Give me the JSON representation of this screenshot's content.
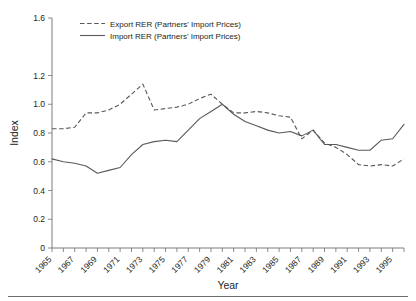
{
  "chart_data": {
    "type": "line",
    "title": "",
    "xlabel": "Year",
    "ylabel": "Index",
    "xlim": [
      1965,
      1996
    ],
    "ylim": [
      0,
      1.6
    ],
    "grid": false,
    "legend_position": "top-left-inside",
    "y_ticks": [
      "0",
      "0.2",
      "0.4",
      "0.6",
      "0.8",
      "1.0",
      "1.2",
      "1.6"
    ],
    "y_tick_values": [
      0,
      0.2,
      0.4,
      0.6,
      0.8,
      1.0,
      1.2,
      1.6
    ],
    "x_tick_labels": [
      "1965",
      "1967",
      "1969",
      "1971",
      "1973",
      "1975",
      "1977",
      "1979",
      "1981",
      "1983",
      "1985",
      "1987",
      "1989",
      "1991",
      "1993",
      "1995"
    ],
    "x_tick_values": [
      1965,
      1967,
      1969,
      1971,
      1973,
      1975,
      1977,
      1979,
      1981,
      1983,
      1985,
      1987,
      1989,
      1991,
      1993,
      1995
    ],
    "x": [
      1965,
      1966,
      1967,
      1968,
      1969,
      1970,
      1971,
      1972,
      1973,
      1974,
      1975,
      1976,
      1977,
      1978,
      1979,
      1980,
      1981,
      1982,
      1983,
      1984,
      1985,
      1986,
      1987,
      1988,
      1989,
      1990,
      1991,
      1992,
      1993,
      1994,
      1995,
      1996
    ],
    "series": [
      {
        "name": "Export RER (Partners' Import Prices)",
        "style": "dashed",
        "color": "#58595b",
        "values": [
          0.83,
          0.83,
          0.84,
          0.94,
          0.94,
          0.96,
          1.0,
          1.07,
          1.14,
          0.96,
          0.97,
          0.98,
          1.0,
          1.04,
          1.07,
          1.0,
          0.94,
          0.94,
          0.95,
          0.94,
          0.92,
          0.91,
          0.76,
          0.82,
          0.73,
          0.7,
          0.65,
          0.58,
          0.57,
          0.58,
          0.57,
          0.62
        ]
      },
      {
        "name": "Import RER (Partners' Import Prices)",
        "style": "solid",
        "color": "#58595b",
        "values": [
          0.62,
          0.6,
          0.59,
          0.57,
          0.52,
          0.54,
          0.56,
          0.65,
          0.72,
          0.74,
          0.75,
          0.74,
          0.82,
          0.9,
          0.95,
          1.0,
          0.93,
          0.88,
          0.85,
          0.82,
          0.8,
          0.81,
          0.78,
          0.82,
          0.72,
          0.72,
          0.7,
          0.68,
          0.68,
          0.75,
          0.76,
          0.86
        ]
      }
    ]
  },
  "axes": {
    "y_axis_title": "Index",
    "x_axis_title": "Year"
  },
  "legend": {
    "items": [
      {
        "label": "Export RER (Partners' Import Prices)",
        "style": "dashed"
      },
      {
        "label": "Import RER (Partners' Import Prices)",
        "style": "solid"
      }
    ]
  },
  "colors": {
    "line": "#58595b",
    "axis": "#6d6e71",
    "text": "#231f20",
    "background": "#ffffff"
  }
}
